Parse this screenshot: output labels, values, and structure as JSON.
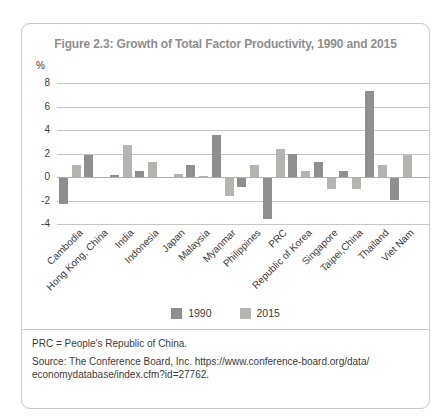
{
  "chart_data": {
    "type": "bar",
    "title": "Figure 2.3: Growth of Total Factor Productivity, 1990 and 2015",
    "unit_label": "%",
    "categories": [
      "Cambodia",
      "Hong Kong, China",
      "India",
      "Indonesia",
      "Japan",
      "Malaysia",
      "Myanmar",
      "Philippines",
      "PRC",
      "Republic of Korea",
      "Singapore",
      "Taipei,China",
      "Thailand",
      "Viet Nam"
    ],
    "series": [
      {
        "name": "1990",
        "color": "#8f8f8e",
        "values": [
          -2.2,
          1.9,
          0.2,
          0.5,
          0,
          1.0,
          3.6,
          -0.8,
          -3.5,
          2.0,
          1.3,
          0.5,
          7.3,
          -1.9
        ]
      },
      {
        "name": "2015",
        "color": "#b6b4b1",
        "values": [
          1.0,
          0,
          2.7,
          1.3,
          0.3,
          0.1,
          -1.5,
          1.0,
          2.4,
          0.5,
          -0.9,
          -0.9,
          1.0,
          1.9
        ]
      }
    ],
    "yticks": [
      8,
      6,
      4,
      2,
      0,
      -2,
      -4
    ],
    "ylim": [
      -4.6,
      8.8
    ],
    "grid": true,
    "legend_position": "bottom"
  },
  "footer": {
    "note": "PRC = People's Republic of China.",
    "source_line1": "Source: The Conference Board, Inc. https://www.conference-board.org/data/",
    "source_line2": "economydatabase/index.cfm?id=27762."
  }
}
